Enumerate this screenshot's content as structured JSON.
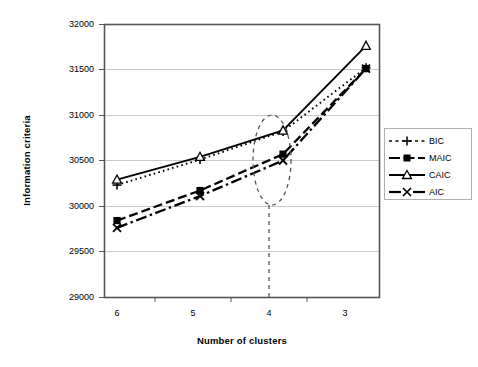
{
  "chart_data": {
    "type": "line",
    "title": "",
    "xlabel": "Number of clusters",
    "ylabel": "Information criteria",
    "categories": [
      "6",
      "5",
      "4",
      "3"
    ],
    "x_tick_labels": [
      "6",
      "5",
      "4",
      "3"
    ],
    "y_tick_labels": [
      "29000",
      "29500",
      "30000",
      "30500",
      "31000",
      "31500",
      "32000"
    ],
    "ylim": [
      29000,
      32000
    ],
    "y_tick_step": 500,
    "grid": "horizontal",
    "legend_position": "right",
    "series": [
      {
        "name": "BIC",
        "values": [
          30230,
          30510,
          30820,
          31520
        ],
        "line_style": "dotted",
        "marker": "plus",
        "color": "#000000"
      },
      {
        "name": "MAIC",
        "values": [
          29840,
          30170,
          30570,
          31510
        ],
        "line_style": "dashed",
        "marker": "filled-square",
        "color": "#000000"
      },
      {
        "name": "CAIC",
        "values": [
          30290,
          30540,
          30830,
          31760
        ],
        "line_style": "solid",
        "marker": "open-triangle",
        "color": "#000000"
      },
      {
        "name": "AIC",
        "values": [
          29760,
          30110,
          30500,
          31510
        ],
        "line_style": "dash-dot",
        "marker": "cross-x",
        "color": "#000000"
      }
    ],
    "annotations": [
      {
        "type": "ellipse",
        "name": "selected-cluster-highlight",
        "at_category": "4",
        "style": "dashed"
      },
      {
        "type": "vertical-line",
        "name": "selected-cluster-dropline",
        "at_category": "4",
        "style": "dashed"
      }
    ]
  },
  "legend": {
    "items": [
      {
        "label": "BIC"
      },
      {
        "label": "MAIC"
      },
      {
        "label": "CAIC"
      },
      {
        "label": "AIC"
      }
    ]
  },
  "axes": {
    "x_title": "Number of clusters",
    "y_title": "Information criteria"
  }
}
